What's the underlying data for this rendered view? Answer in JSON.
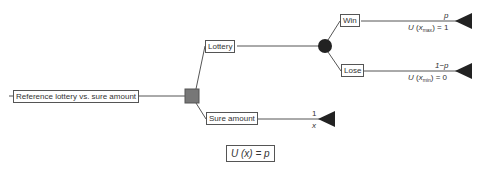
{
  "diagram": {
    "type": "decision-tree",
    "root": {
      "label": "Reference lottery vs. sure amount"
    },
    "decision_node": {
      "shape": "square",
      "color": "#777777"
    },
    "branches": {
      "lottery": {
        "label": "Lottery",
        "chance_node": {
          "shape": "circle",
          "color": "#222222"
        },
        "outcomes": {
          "win": {
            "label": "Win",
            "probability": "p",
            "utility_fn": "U",
            "utility_arg": "x",
            "utility_sub": "max",
            "utility_value": "= 1"
          },
          "lose": {
            "label": "Lose",
            "probability": "1−p",
            "utility_fn": "U",
            "utility_arg": "x",
            "utility_sub": "min",
            "utility_value": "= 0"
          }
        }
      },
      "sure": {
        "label": "Sure amount",
        "probability": "1",
        "value": "x"
      }
    },
    "formula": "U (x) = p",
    "colors": {
      "line": "#555555",
      "terminal": "#222222",
      "decision": "#777777",
      "chance": "#222222"
    }
  }
}
